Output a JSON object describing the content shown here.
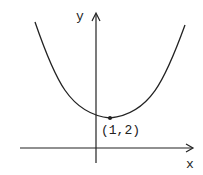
{
  "diagram": {
    "type": "function-graph",
    "axes": {
      "x_label": "x",
      "y_label": "y"
    },
    "vertex": {
      "label": "(1,2)",
      "x": 1,
      "y": 2
    },
    "colors": {
      "ink": "#222222",
      "background": "#ffffff"
    }
  }
}
